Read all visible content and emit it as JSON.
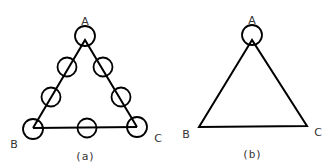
{
  "figures": [
    {
      "id": "a",
      "caption": "(a)",
      "vertices": [
        {
          "name": "A",
          "label": "A"
        },
        {
          "name": "B",
          "label": "B"
        },
        {
          "name": "C",
          "label": "C"
        }
      ],
      "circle_count": 8
    },
    {
      "id": "b",
      "caption": "(b)",
      "vertices": [
        {
          "name": "A",
          "label": "A"
        },
        {
          "name": "B",
          "label": "B"
        },
        {
          "name": "C",
          "label": "C"
        }
      ],
      "circle_count": 1
    }
  ],
  "colors": {
    "stroke": "#000000",
    "text": "#333333",
    "background": "#ffffff"
  }
}
